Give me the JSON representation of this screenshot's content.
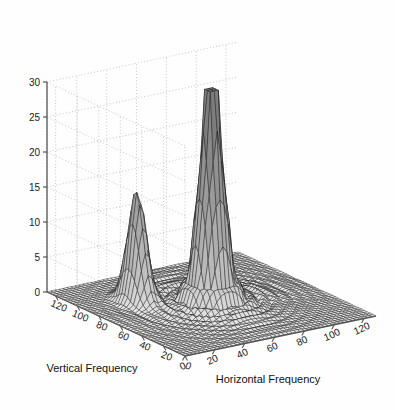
{
  "figure": {
    "background_color": "#ffffff",
    "mesh_color": "#1a1a1a",
    "grid_color": "#b0b0b0",
    "axis_color": "#555555",
    "text_color": "#111111"
  },
  "chart_data": {
    "type": "surface",
    "title": "",
    "subtitle": "",
    "xlabel": "Horizontal Frequency",
    "ylabel": "Vertical Frequency",
    "zlabel": "",
    "xlim": [
      0,
      128
    ],
    "ylim": [
      0,
      128
    ],
    "zlim": [
      0,
      30
    ],
    "xticks": [
      0,
      20,
      40,
      60,
      80,
      100,
      120
    ],
    "yticks": [
      0,
      20,
      40,
      60,
      80,
      100,
      120
    ],
    "zticks": [
      0,
      5,
      10,
      15,
      20,
      25,
      30
    ],
    "xtick_labels": [
      "0",
      "20",
      "40",
      "60",
      "80",
      "100",
      "120"
    ],
    "ytick_labels": [
      "0",
      "20",
      "40",
      "60",
      "80",
      "100",
      "120"
    ],
    "ztick_labels": [
      "0",
      "5",
      "10",
      "15",
      "20",
      "25",
      "30"
    ],
    "grid": true,
    "legend": null,
    "legend_position": "none",
    "render_style": "wireframe-mesh",
    "colormap": "gray",
    "view_azimuth": -37.5,
    "view_elevation": 30,
    "grid_n": 49,
    "peaks": [
      {
        "name": "primary-peak",
        "x": 64,
        "y": 64,
        "height": 30.0,
        "sigma_x": 5.5,
        "sigma_y": 5.5
      },
      {
        "name": "secondary-peak",
        "x": 30,
        "y": 86,
        "height": 16.0,
        "sigma_x": 4.0,
        "sigma_y": 7.0
      }
    ],
    "ripple": {
      "description": "sinc-like sidelobe ripples radiating from center",
      "amplitude": 2.6,
      "period": 13.0,
      "decay": 34.0
    },
    "baseline": 0.0
  }
}
